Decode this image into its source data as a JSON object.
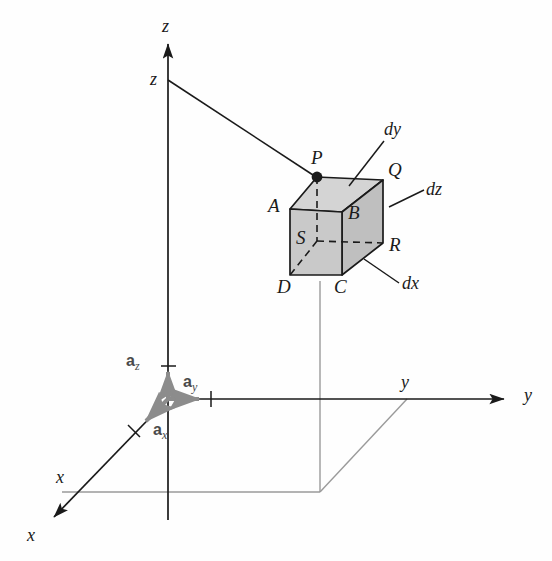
{
  "figure": {
    "colors": {
      "line": "#1a1a1a",
      "cube_fill": "#c9c9c9",
      "cube_fill_top": "#d4d4d4",
      "cube_fill_side": "#bfbfbf",
      "projection_line": "#9a9a9a",
      "unit_vector": "#8c8c8c",
      "background": "#fefefe"
    }
  },
  "axes": {
    "z_tip_label": "z",
    "z_point_label": "z",
    "y_tip_label": "y",
    "y_point_label": "y",
    "x_tip_label": "x",
    "x_point_label": "x"
  },
  "unit_vectors": {
    "az": {
      "symbol": "a",
      "subscript": "z"
    },
    "ay": {
      "symbol": "a",
      "subscript": "y"
    },
    "ax": {
      "symbol": "a",
      "subscript": "x"
    }
  },
  "cube": {
    "vertices": [
      {
        "id": "P",
        "label": "P",
        "desc": "top-back-left (marked point)"
      },
      {
        "id": "Q",
        "label": "Q",
        "desc": "top-back-right"
      },
      {
        "id": "A",
        "label": "A",
        "desc": "top-front-left"
      },
      {
        "id": "B",
        "label": "B",
        "desc": "top-front-right"
      },
      {
        "id": "S",
        "label": "S",
        "desc": "bottom-back-left (hidden)"
      },
      {
        "id": "R",
        "label": "R",
        "desc": "bottom-back-right"
      },
      {
        "id": "D",
        "label": "D",
        "desc": "bottom-front-left"
      },
      {
        "id": "C",
        "label": "C",
        "desc": "bottom-front-right"
      }
    ],
    "dimensions": [
      {
        "id": "dy",
        "label": "dy",
        "edge": "top face depth"
      },
      {
        "id": "dz",
        "label": "dz",
        "edge": "right face height"
      },
      {
        "id": "dx",
        "label": "dx",
        "edge": "bottom-right depth"
      }
    ]
  }
}
